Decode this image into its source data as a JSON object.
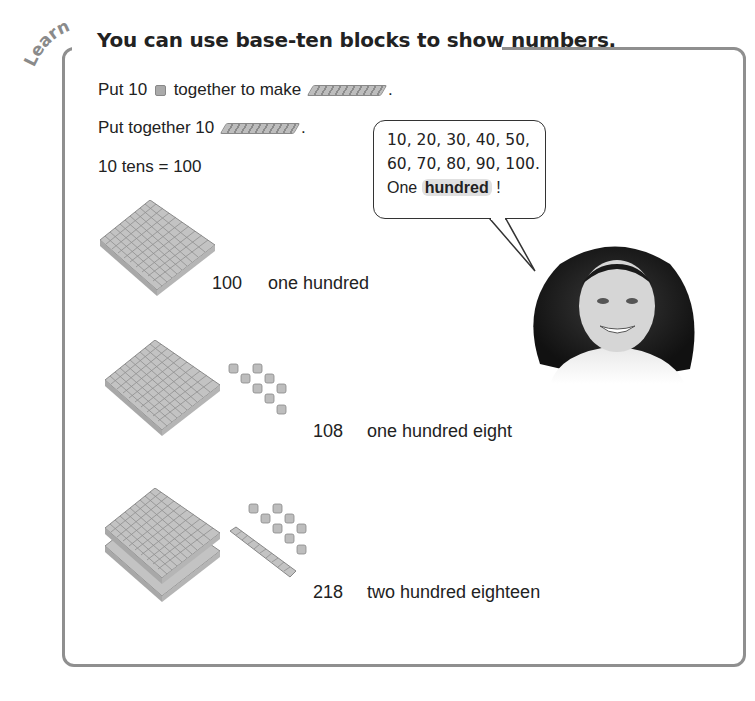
{
  "lesson": {
    "tag": "Learn",
    "title": "You can use base-ten blocks to show numbers.",
    "lines": [
      {
        "before": "Put 10",
        "middle": "together to make",
        "after": "."
      },
      {
        "before": "Put together 10",
        "after": "."
      },
      {
        "text": "10 tens = 100"
      }
    ],
    "speech_bubble": {
      "line1": "10, 20, 30, 40, 50,",
      "line2": "60, 70, 80, 90, 100.",
      "line3_prefix": "One",
      "line3_highlight": "hundred",
      "line3_suffix": "!"
    },
    "examples": [
      {
        "number": "100",
        "words": "one hundred",
        "hundreds": 1,
        "tens": 0,
        "ones": 0
      },
      {
        "number": "108",
        "words": "one hundred eight",
        "hundreds": 1,
        "tens": 0,
        "ones": 8
      },
      {
        "number": "218",
        "words": "two hundred eighteen",
        "hundreds": 2,
        "tens": 1,
        "ones": 8
      }
    ],
    "colors": {
      "frame": "#8f8f8f",
      "block": "#bdbdbd",
      "highlight": "#e0e0e0"
    }
  }
}
